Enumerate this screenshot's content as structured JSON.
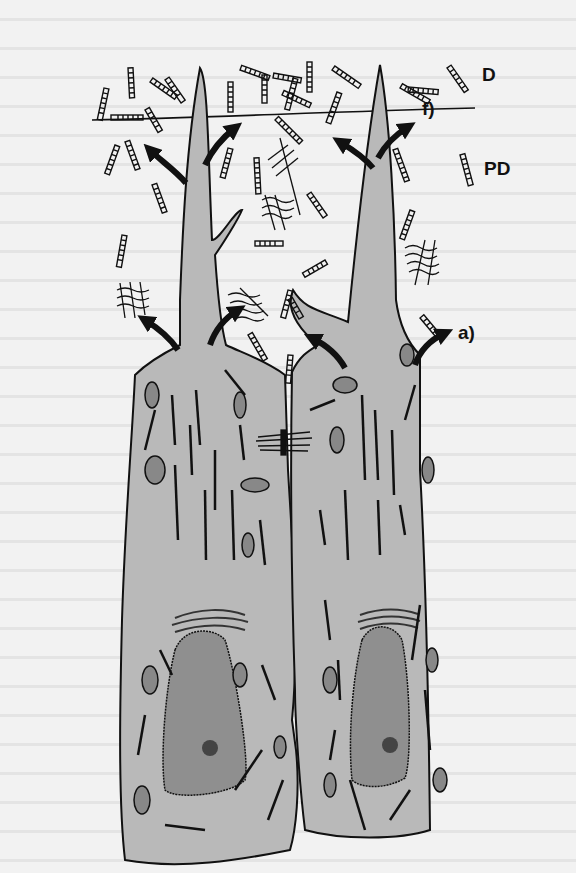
{
  "figure": {
    "type": "diagram",
    "labels": {
      "d": "D",
      "pd": "PD",
      "f": "f)",
      "a": "a)"
    },
    "colors": {
      "background": "#f2f2f2",
      "cytoplasm": "#b9b9b9",
      "nucleus": "#8f8f8f",
      "outline": "#111111",
      "arrow": "#111111"
    }
  }
}
